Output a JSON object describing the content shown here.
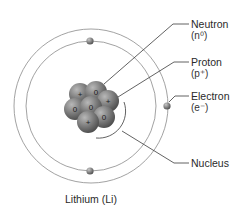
{
  "title": "Lithium (Li)",
  "labels": {
    "neutron": {
      "name": "Neutron",
      "symbol": "(n⁰)"
    },
    "proton": {
      "name": "Proton",
      "symbol": "(p⁺)"
    },
    "electron": {
      "name": "Electron",
      "symbol": "(e⁻)"
    },
    "nucleus": {
      "name": "Nucleus"
    }
  },
  "nucleus_particles": [
    {
      "type": "proton",
      "sign": "+"
    },
    {
      "type": "neutron",
      "sign": "0"
    },
    {
      "type": "proton",
      "sign": "+"
    },
    {
      "type": "neutron",
      "sign": "0"
    },
    {
      "type": "neutron",
      "sign": "0"
    },
    {
      "type": "neutron",
      "sign": "0"
    },
    {
      "type": "proton",
      "sign": "+"
    }
  ],
  "counts": {
    "protons": 3,
    "neutrons": 4,
    "electrons": 3
  },
  "colors": {
    "orbit": "#8a8a8a",
    "particle": "#6e6e6e",
    "leader": "#3a3a3a",
    "text": "#2a2a2a"
  }
}
